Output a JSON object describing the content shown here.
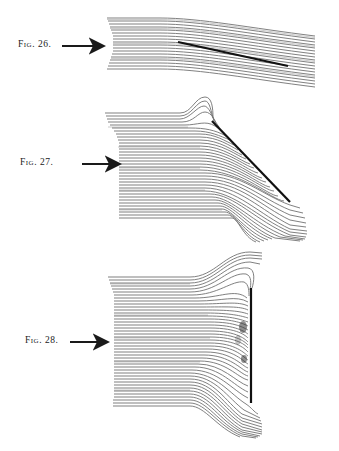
{
  "figures": [
    {
      "id": "fig26",
      "label": "Fig. 26.",
      "description": "Streamlines flowing past a thin plate aligned nearly with the flow"
    },
    {
      "id": "fig27",
      "label": "Fig. 27.",
      "description": "Streamlines deflected by an inclined plate"
    },
    {
      "id": "fig28",
      "label": "Fig. 28.",
      "description": "Streamlines deflected by a plate perpendicular to the flow"
    }
  ],
  "colors": {
    "background": "#ffffff",
    "ink": "#1a1a1a",
    "streamline": "#555555",
    "plate": "#111111"
  }
}
